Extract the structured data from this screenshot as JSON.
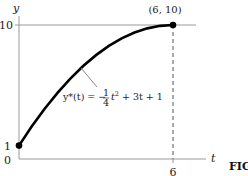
{
  "chart_data": {
    "type": "line",
    "title": "",
    "xlabel": "t",
    "ylabel": "y",
    "xlim": [
      0,
      6
    ],
    "ylim": [
      0,
      10
    ],
    "x_ticks": [
      "0",
      "6"
    ],
    "y_ticks": [
      "1",
      "10"
    ],
    "grid": false,
    "function": "y(t) = -1/4 t^2 + 3t + 1",
    "series": [
      {
        "name": "y*(t)",
        "x": [
          0,
          0.5,
          1,
          1.5,
          2,
          2.5,
          3,
          3.5,
          4,
          4.5,
          5,
          5.5,
          6
        ],
        "y": [
          1,
          2.4375,
          3.75,
          4.9375,
          6,
          6.9375,
          7.75,
          8.4375,
          9,
          9.4375,
          9.75,
          9.9375,
          10
        ]
      }
    ],
    "points": [
      {
        "x": 0,
        "y": 1
      },
      {
        "x": 6,
        "y": 10,
        "label": "(6, 10)"
      }
    ],
    "reference_lines": [
      {
        "type": "horizontal",
        "y": 10,
        "style": "solid"
      },
      {
        "type": "vertical",
        "x": 6,
        "style": "dashed"
      }
    ],
    "annotations": {
      "equation_lhs": "y*(t) = −",
      "frac_num": "1",
      "frac_den": "4",
      "equation_rhs_t": "t",
      "equation_rhs_exp": "2",
      "equation_rhs_tail": " + 3t + 1",
      "point_label": "(6, 10)"
    },
    "figure_label": "FIG"
  }
}
